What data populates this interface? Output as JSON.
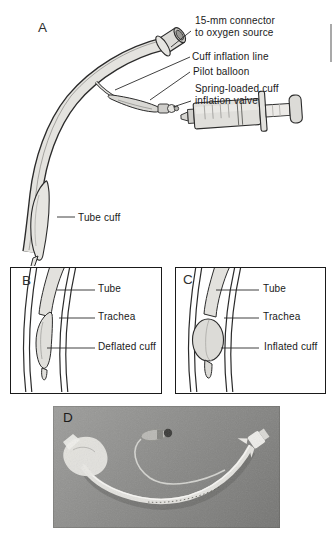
{
  "panels": {
    "a": {
      "letter": "A",
      "labels": {
        "connector_l1": "15-mm connector",
        "connector_l2": "to oxygen source",
        "cuff_line": "Cuff inflation line",
        "pilot": "Pilot balloon",
        "valve_l1": "Spring-loaded cuff",
        "valve_l2": "inflation valve",
        "tube_cuff": "Tube cuff"
      }
    },
    "b": {
      "letter": "B",
      "labels": {
        "tube": "Tube",
        "trachea": "Trachea",
        "cuff": "Deflated cuff"
      }
    },
    "c": {
      "letter": "C",
      "labels": {
        "tube": "Tube",
        "trachea": "Trachea",
        "cuff": "Inflated cuff"
      }
    },
    "d": {
      "letter": "D"
    }
  },
  "colors": {
    "outline": "#2b2b2b",
    "tube_fill": "#e4e3df",
    "photo_background": "#8b8b89",
    "label_text": "#1a1a1a",
    "page_background": "#ffffff"
  }
}
